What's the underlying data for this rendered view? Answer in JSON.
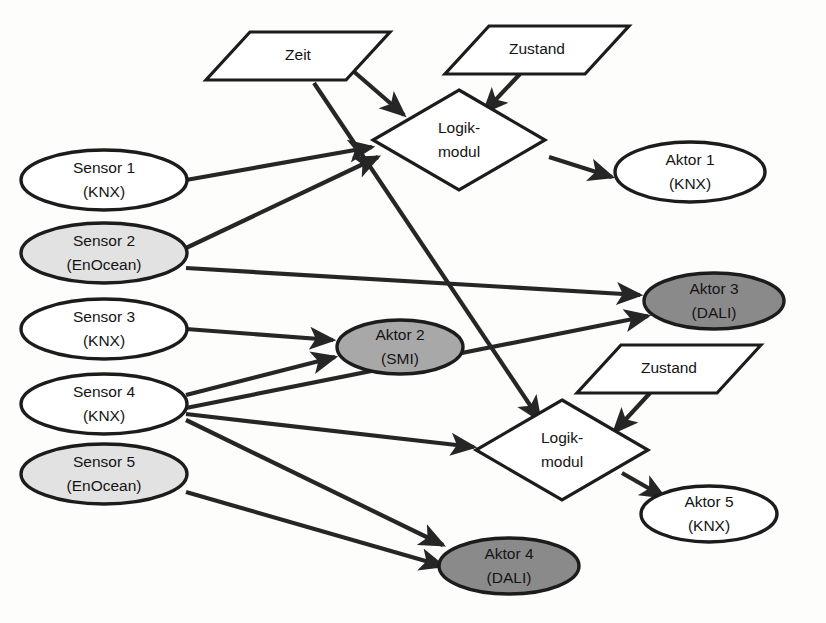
{
  "diagram": {
    "background": "#fdfdfc",
    "stroke_color": "#1c1c1c",
    "edge_color": "#262626",
    "fills": {
      "white": "#ffffff",
      "light_gray": "#e2e2e2",
      "mid_gray": "#a8a8a8",
      "dark_gray": "#8a8a8a"
    },
    "nodes": [
      {
        "id": "zeit1",
        "kind": "parallelogram",
        "line1": "Zeit",
        "line2": "",
        "cx": 298,
        "cy": 56,
        "w": 140,
        "h": 48,
        "skew": 22,
        "fill": "#ffffff"
      },
      {
        "id": "zustand1",
        "kind": "parallelogram",
        "line1": "Zustand",
        "line2": "",
        "cx": 537,
        "cy": 50,
        "w": 140,
        "h": 48,
        "skew": 22,
        "fill": "#ffffff"
      },
      {
        "id": "logik1",
        "kind": "diamond",
        "line1": "Logik-",
        "line2": "modul",
        "cx": 459,
        "cy": 140,
        "w": 172,
        "h": 100,
        "fill": "#ffffff"
      },
      {
        "id": "zustand2",
        "kind": "parallelogram",
        "line1": "Zustand",
        "line2": "",
        "cx": 669,
        "cy": 369,
        "w": 140,
        "h": 48,
        "skew": 22,
        "fill": "#ffffff"
      },
      {
        "id": "logik2",
        "kind": "diamond",
        "line1": "Logik-",
        "line2": "modul",
        "cx": 562,
        "cy": 450,
        "w": 172,
        "h": 100,
        "fill": "#ffffff"
      },
      {
        "id": "sensor1",
        "kind": "ellipse",
        "line1": "Sensor 1",
        "line2": "(KNX)",
        "cx": 104,
        "cy": 180,
        "w": 166,
        "h": 60,
        "fill": "#ffffff"
      },
      {
        "id": "sensor2",
        "kind": "ellipse",
        "line1": "Sensor 2",
        "line2": "(EnOcean)",
        "cx": 104,
        "cy": 253,
        "w": 166,
        "h": 60,
        "fill": "#e2e2e2"
      },
      {
        "id": "sensor3",
        "kind": "ellipse",
        "line1": "Sensor 3",
        "line2": "(KNX)",
        "cx": 104,
        "cy": 329,
        "w": 166,
        "h": 60,
        "fill": "#ffffff"
      },
      {
        "id": "sensor4",
        "kind": "ellipse",
        "line1": "Sensor 4",
        "line2": "(KNX)",
        "cx": 104,
        "cy": 404,
        "w": 166,
        "h": 60,
        "fill": "#ffffff"
      },
      {
        "id": "sensor5",
        "kind": "ellipse",
        "line1": "Sensor 5",
        "line2": "(EnOcean)",
        "cx": 104,
        "cy": 474,
        "w": 166,
        "h": 60,
        "fill": "#e2e2e2"
      },
      {
        "id": "aktor1",
        "kind": "ellipse",
        "line1": "Aktor 1",
        "line2": "(KNX)",
        "cx": 690,
        "cy": 172,
        "w": 150,
        "h": 60,
        "fill": "#ffffff"
      },
      {
        "id": "aktor2",
        "kind": "ellipse",
        "line1": "Aktor 2",
        "line2": "(SMI)",
        "cx": 400,
        "cy": 347,
        "w": 126,
        "h": 54,
        "fill": "#a8a8a8"
      },
      {
        "id": "aktor3",
        "kind": "ellipse",
        "line1": "Aktor 3",
        "line2": "(DALI)",
        "cx": 714,
        "cy": 301,
        "w": 140,
        "h": 56,
        "fill": "#8a8a8a"
      },
      {
        "id": "aktor4",
        "kind": "ellipse",
        "line1": "Aktor 4",
        "line2": "(DALI)",
        "cx": 509,
        "cy": 566,
        "w": 140,
        "h": 56,
        "fill": "#8a8a8a"
      },
      {
        "id": "aktor5",
        "kind": "ellipse",
        "line1": "Aktor 5",
        "line2": "(KNX)",
        "cx": 709,
        "cy": 514,
        "w": 136,
        "h": 56,
        "fill": "#ffffff"
      }
    ],
    "edges": [
      {
        "id": "e-zeit1-logik1",
        "from": "zeit1",
        "to": "logik1",
        "x1": 352,
        "y1": 70,
        "x2": 404,
        "y2": 115,
        "arrow": true
      },
      {
        "id": "e-zeit1-logik2",
        "from": "zeit1",
        "to": "logik2",
        "x1": 314,
        "y1": 83,
        "x2": 540,
        "y2": 420,
        "arrow": true
      },
      {
        "id": "e-zustand1-logik1",
        "from": "zustand1",
        "to": "logik1",
        "x1": 520,
        "y1": 74,
        "x2": 484,
        "y2": 112,
        "arrow": true
      },
      {
        "id": "e-logik1-aktor1",
        "from": "logik1",
        "to": "aktor1",
        "x1": 549,
        "y1": 157,
        "x2": 612,
        "y2": 177,
        "arrow": true
      },
      {
        "id": "e-sensor1-logik1",
        "from": "sensor1",
        "to": "logik1",
        "x1": 186,
        "y1": 180,
        "x2": 372,
        "y2": 147,
        "arrow": true
      },
      {
        "id": "e-sensor2-logik1",
        "from": "sensor2",
        "to": "logik1",
        "x1": 186,
        "y1": 248,
        "x2": 378,
        "y2": 157,
        "arrow": true
      },
      {
        "id": "e-sensor2-aktor3",
        "from": "sensor2",
        "to": "aktor3",
        "x1": 186,
        "y1": 268,
        "x2": 640,
        "y2": 295,
        "arrow": true
      },
      {
        "id": "e-sensor3-aktor2",
        "from": "sensor3",
        "to": "aktor2",
        "x1": 186,
        "y1": 329,
        "x2": 333,
        "y2": 340,
        "arrow": true
      },
      {
        "id": "e-sensor4-aktor2",
        "from": "sensor4",
        "to": "aktor2",
        "x1": 186,
        "y1": 395,
        "x2": 335,
        "y2": 357,
        "arrow": true
      },
      {
        "id": "e-sensor4-aktor3",
        "from": "sensor4",
        "to": "aktor3",
        "x1": 186,
        "y1": 408,
        "x2": 648,
        "y2": 316,
        "arrow": true
      },
      {
        "id": "e-sensor4-logik2",
        "from": "sensor4",
        "to": "logik2",
        "x1": 186,
        "y1": 414,
        "x2": 474,
        "y2": 447,
        "arrow": true
      },
      {
        "id": "e-sensor4-aktor4",
        "from": "sensor4",
        "to": "aktor4",
        "x1": 186,
        "y1": 420,
        "x2": 443,
        "y2": 545,
        "arrow": true
      },
      {
        "id": "e-sensor5-aktor4",
        "from": "sensor5",
        "to": "aktor4",
        "x1": 186,
        "y1": 492,
        "x2": 443,
        "y2": 566,
        "arrow": true
      },
      {
        "id": "e-zustand2-logik2",
        "from": "zustand2",
        "to": "logik2",
        "x1": 650,
        "y1": 393,
        "x2": 614,
        "y2": 432,
        "arrow": true
      },
      {
        "id": "e-logik2-aktor5",
        "from": "logik2",
        "to": "aktor5",
        "x1": 622,
        "y1": 473,
        "x2": 664,
        "y2": 497,
        "arrow": true
      }
    ]
  }
}
